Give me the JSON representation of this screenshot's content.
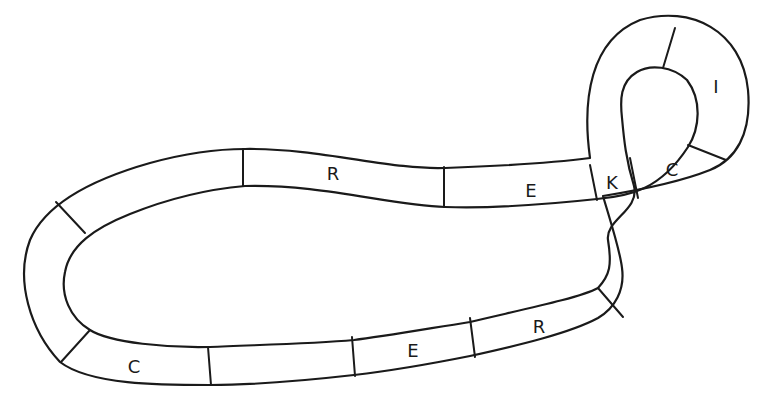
{
  "diagram": {
    "stroke_color": "#1a1a1a",
    "background": "#ffffff",
    "cells": [
      {
        "id": "cell-top-r",
        "label": "R",
        "x": 333,
        "y": 174
      },
      {
        "id": "cell-top-e",
        "label": "E",
        "x": 531,
        "y": 191
      },
      {
        "id": "cell-k",
        "label": "K",
        "x": 612,
        "y": 183
      },
      {
        "id": "cell-loop-c",
        "label": "C",
        "x": 672,
        "y": 170
      },
      {
        "id": "cell-loop-i",
        "label": "I",
        "x": 716,
        "y": 87
      },
      {
        "id": "cell-bottom-c",
        "label": "C",
        "x": 134,
        "y": 367
      },
      {
        "id": "cell-bottom-blank",
        "label": "",
        "x": 280,
        "y": 360
      },
      {
        "id": "cell-bottom-e",
        "label": "E",
        "x": 413,
        "y": 351
      },
      {
        "id": "cell-bottom-r",
        "label": "R",
        "x": 539,
        "y": 327
      }
    ]
  }
}
